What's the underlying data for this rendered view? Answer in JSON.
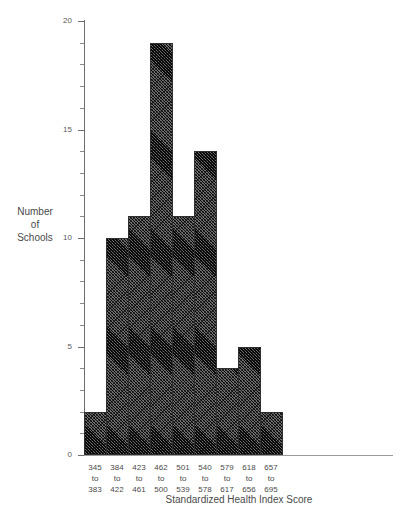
{
  "figure": {
    "top_cut_text": "",
    "background_color": "#ffffff",
    "bar_fill_color": "#6d6d6d",
    "bar_edge_color": "#2f2f2f",
    "axis_color": "#6e6e6e",
    "text_color": "#4a4a4a"
  },
  "axes": {
    "y_title_lines": [
      "Number",
      "of",
      "Schools"
    ],
    "x_title": "Standardized Health Index Score"
  },
  "chart_data": {
    "type": "bar",
    "title": "",
    "subtitle": "",
    "xlabel": "Standardized Health Index Score",
    "ylabel": "Number of Schools",
    "categories": [
      "345 to 383",
      "384 to 422",
      "423 to 461",
      "462 to 500",
      "501 to 539",
      "540 to 578",
      "579 to 617",
      "618 to 656",
      "657 to 695"
    ],
    "category_lines": [
      [
        "345",
        "to",
        "383"
      ],
      [
        "384",
        "to",
        "422"
      ],
      [
        "423",
        "to",
        "461"
      ],
      [
        "462",
        "to",
        "500"
      ],
      [
        "501",
        "to",
        "539"
      ],
      [
        "540",
        "to",
        "578"
      ],
      [
        "579",
        "to",
        "617"
      ],
      [
        "618",
        "to",
        "656"
      ],
      [
        "657",
        "to",
        "695"
      ]
    ],
    "values": [
      2,
      10,
      11,
      19,
      11,
      14,
      4,
      5,
      2
    ],
    "ylim": [
      0,
      20
    ],
    "y_major_ticks": [
      0,
      5,
      10,
      15,
      20
    ],
    "y_major_tick_labels": [
      "0",
      "5",
      "10",
      "15",
      "20"
    ],
    "y_minor_tick_step": 1,
    "grid": false,
    "legend": false,
    "legend_position": "none",
    "bin_width": 39,
    "x_range": [
      345,
      695
    ]
  }
}
